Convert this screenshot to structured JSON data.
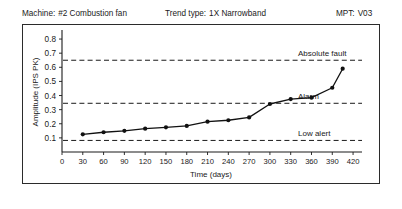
{
  "header": {
    "machine_label": "Machine:",
    "machine_value": "#2  Combustion fan",
    "trend_label": "Trend type:",
    "trend_value": "1X Narrowband",
    "mpt_label": "MPT:",
    "mpt_value": "V03"
  },
  "chart_data": {
    "type": "line",
    "title": "",
    "xlabel": "Time (days)",
    "ylabel": "Amplitude (IPS PK)",
    "xlim": [
      0,
      430
    ],
    "ylim": [
      0.0,
      0.85
    ],
    "xticks": [
      0,
      30,
      60,
      90,
      120,
      150,
      180,
      210,
      240,
      270,
      300,
      330,
      360,
      390,
      420
    ],
    "yticks": [
      0.1,
      0.2,
      0.3,
      0.4,
      0.5,
      0.6,
      0.7,
      0.8
    ],
    "grid": false,
    "legend_position": "none",
    "series": [
      {
        "name": "1X Narrowband amplitude",
        "x": [
          30,
          60,
          90,
          120,
          150,
          180,
          210,
          240,
          270,
          300,
          330,
          360,
          390,
          405
        ],
        "values": [
          0.125,
          0.14,
          0.15,
          0.165,
          0.175,
          0.185,
          0.215,
          0.225,
          0.245,
          0.34,
          0.375,
          0.385,
          0.455,
          0.59
        ]
      }
    ],
    "thresholds": [
      {
        "name": "absolute-fault",
        "label": "Absolute fault",
        "value": 0.65
      },
      {
        "name": "alarm",
        "label": "Alarm",
        "value": 0.345
      },
      {
        "name": "low-alert",
        "label": "Low alert",
        "value": 0.082
      }
    ]
  }
}
